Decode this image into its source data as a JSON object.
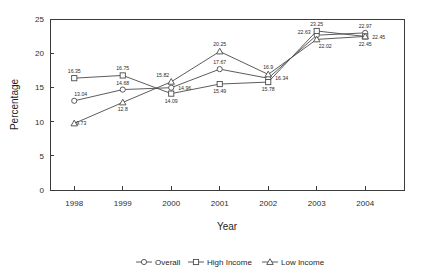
{
  "chart_data": {
    "type": "line",
    "title": "",
    "xlabel": "Year",
    "ylabel": "Percentage",
    "categories": [
      "1998",
      "1999",
      "2000",
      "2001",
      "2002",
      "2003",
      "2004"
    ],
    "x": [
      1998,
      1999,
      2000,
      2001,
      2002,
      2003,
      2004
    ],
    "xlim": [
      1997.5,
      2004.8
    ],
    "ylim": [
      0,
      25
    ],
    "yticks": [
      0,
      5,
      10,
      15,
      20,
      25
    ],
    "ytick_labels": [
      "0",
      "5",
      "10",
      "15",
      "20",
      "25"
    ],
    "grid": false,
    "legend_position": "bottom",
    "series": [
      {
        "name": "Overall",
        "marker": "circle",
        "values": [
          13.04,
          14.68,
          14.96,
          17.67,
          16.34,
          22.63,
          22.97
        ],
        "labels": [
          "13.04",
          "14.68",
          "14.96",
          "17.67",
          "16.34",
          "22.63",
          "22.97"
        ]
      },
      {
        "name": "High Income",
        "marker": "square",
        "values": [
          16.35,
          16.75,
          14.09,
          15.49,
          15.78,
          23.25,
          22.45
        ],
        "labels": [
          "16.35",
          "16.75",
          "14.09",
          "15.49",
          "15.78",
          "23.25",
          "22.45"
        ]
      },
      {
        "name": "Low Income",
        "marker": "triangle",
        "values": [
          9.73,
          12.8,
          15.82,
          20.25,
          16.9,
          22.02,
          22.45
        ],
        "labels": [
          "9.73",
          "12.8",
          "15.82",
          "20.25",
          "16.9",
          "22.02",
          "22.45"
        ]
      }
    ],
    "legend": [
      {
        "label": "Overall",
        "marker": "circle"
      },
      {
        "label": "High Income",
        "marker": "square"
      },
      {
        "label": "Low Income",
        "marker": "triangle"
      }
    ],
    "colors": {
      "axis": "#3a3a3a",
      "line": "#4a4a4a",
      "marker_fill": "#ffffff",
      "text": "#2b2b2b",
      "background": "#ffffff"
    }
  },
  "label_offsets": {
    "Overall": [
      [
        0,
        -5,
        "start"
      ],
      [
        0,
        -5,
        "mid"
      ],
      [
        7,
        2,
        "start"
      ],
      [
        0,
        -5,
        "mid"
      ],
      [
        7,
        2,
        "start"
      ],
      [
        -6,
        -1,
        "end"
      ],
      [
        0,
        -5,
        "mid"
      ]
    ],
    "High Income": [
      [
        0,
        -5,
        "mid"
      ],
      [
        0,
        -5,
        "mid"
      ],
      [
        0,
        9,
        "mid"
      ],
      [
        0,
        9,
        "mid"
      ],
      [
        0,
        9,
        "mid"
      ],
      [
        0,
        -5,
        "mid"
      ],
      [
        7,
        3,
        "start"
      ]
    ],
    "Low Income": [
      [
        2,
        2,
        "start"
      ],
      [
        0,
        9,
        "mid"
      ],
      [
        -2,
        -5,
        "end"
      ],
      [
        0,
        -5,
        "mid"
      ],
      [
        0,
        -5,
        "mid"
      ],
      [
        2,
        9,
        "start"
      ],
      [
        0,
        10,
        "mid"
      ]
    ]
  }
}
